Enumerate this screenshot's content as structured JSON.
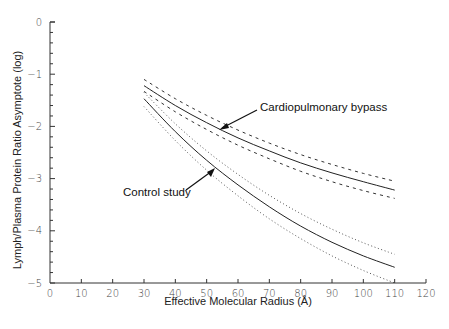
{
  "chart_data": {
    "type": "line",
    "title": "",
    "xlabel": "Effective Molecular Radius (Å)",
    "ylabel": "Lymph/Plasma Protein Ratio Asymptote (log)",
    "xlim": [
      0,
      120
    ],
    "ylim": [
      -5,
      0
    ],
    "x_ticks": [
      "0",
      "10",
      "20",
      "30",
      "40",
      "50",
      "60",
      "70",
      "80",
      "90",
      "100",
      "110",
      "120"
    ],
    "y_ticks": [
      "0",
      "-1",
      "-2",
      "-3",
      "-4",
      "-5"
    ],
    "grid": false,
    "legend": "none (annotations with arrows)",
    "x": [
      30,
      40,
      50,
      60,
      70,
      80,
      90,
      100,
      110
    ],
    "series": [
      {
        "name": "Cardiopulmonary bypass",
        "style": "solid",
        "values": [
          -1.22,
          -1.6,
          -1.93,
          -2.22,
          -2.47,
          -2.7,
          -2.89,
          -3.06,
          -3.22
        ]
      },
      {
        "name": "Cardiopulmonary bypass upper bound",
        "style": "dashed",
        "values": [
          -1.1,
          -1.47,
          -1.79,
          -2.07,
          -2.32,
          -2.54,
          -2.73,
          -2.9,
          -3.05
        ]
      },
      {
        "name": "Cardiopulmonary bypass lower bound",
        "style": "dashed",
        "values": [
          -1.33,
          -1.72,
          -2.06,
          -2.36,
          -2.62,
          -2.86,
          -3.06,
          -3.23,
          -3.38
        ]
      },
      {
        "name": "Control study",
        "style": "solid",
        "values": [
          -1.47,
          -2.1,
          -2.65,
          -3.12,
          -3.54,
          -3.91,
          -4.22,
          -4.48,
          -4.7
        ]
      },
      {
        "name": "Control study upper bound",
        "style": "dotted",
        "values": [
          -1.35,
          -1.95,
          -2.47,
          -2.92,
          -3.32,
          -3.67,
          -3.97,
          -4.23,
          -4.45
        ]
      },
      {
        "name": "Control study lower bound",
        "style": "dotted",
        "values": [
          -1.62,
          -2.27,
          -2.84,
          -3.33,
          -3.77,
          -4.15,
          -4.48,
          -4.76,
          -5.0
        ]
      }
    ],
    "annotations": [
      {
        "text": "Cardiopulmonary bypass",
        "points_to": "Cardiopulmonary bypass curve near x≈55"
      },
      {
        "text": "Control study",
        "points_to": "Control study curve near x≈52"
      }
    ]
  },
  "labels": {
    "xlabel": "Effective Molecular Radius (Å)",
    "ylabel": "Lymph/Plasma Protein Ratio Asymptote (log)",
    "annot_cpb": "Cardiopulmonary bypass",
    "annot_control": "Control study"
  }
}
